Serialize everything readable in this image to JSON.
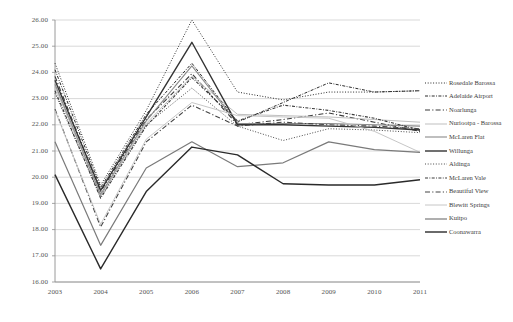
{
  "chart_data": {
    "type": "line",
    "title": "",
    "xlabel": "",
    "ylabel": "",
    "x": [
      2003,
      2004,
      2005,
      2006,
      2007,
      2008,
      2009,
      2010,
      2011
    ],
    "categories": [
      "2003",
      "2004",
      "2005",
      "2006",
      "2007",
      "2008",
      "2009",
      "2010",
      "2011"
    ],
    "ylim": [
      16.0,
      26.0
    ],
    "ytick_labels": [
      "26.00",
      "25.00",
      "24.00",
      "23.00",
      "22.00",
      "21.00",
      "20.00",
      "19.00",
      "18.00",
      "17.00",
      "16.00"
    ],
    "ytick_values": [
      26.0,
      25.0,
      24.0,
      23.0,
      22.0,
      21.0,
      20.0,
      19.0,
      18.0,
      17.0,
      16.0
    ],
    "grid": true,
    "legend_position": "right",
    "series": [
      {
        "name": "Rosedale Barossa",
        "style": "dotted",
        "color": "#2b2b2b",
        "width": 1.0,
        "values": [
          24.35,
          19.7,
          22.55,
          26.0,
          23.25,
          22.95,
          23.25,
          23.25,
          23.3
        ]
      },
      {
        "name": "Adelaide Airport",
        "style": "dash-dot",
        "color": "#2b2b2b",
        "width": 1.0,
        "values": [
          24.1,
          19.6,
          22.4,
          24.35,
          22.1,
          22.85,
          23.6,
          23.25,
          23.3
        ]
      },
      {
        "name": "Nuriootpa",
        "style": "long-dash",
        "color": "#3a3a3a",
        "width": 1.1,
        "values": [
          23.85,
          19.45,
          22.2,
          23.95,
          22.0,
          22.2,
          22.45,
          22.1,
          21.75
        ]
      },
      {
        "name": "Nuriootpa - Barossa",
        "style": "solid",
        "color": "#b8b8b8",
        "width": 0.9,
        "values": [
          23.45,
          19.3,
          22.05,
          23.85,
          22.4,
          22.35,
          22.3,
          22.2,
          22.1
        ]
      },
      {
        "name": "McLaren Flat",
        "style": "solid",
        "color": "#8a8a8a",
        "width": 1.1,
        "values": [
          23.55,
          19.35,
          22.15,
          24.25,
          22.05,
          22.05,
          22.05,
          22.0,
          21.95
        ]
      },
      {
        "name": "Willunga",
        "style": "solid",
        "color": "#333333",
        "width": 1.4,
        "values": [
          23.7,
          19.5,
          22.3,
          25.15,
          22.0,
          22.0,
          21.95,
          21.9,
          21.8
        ]
      },
      {
        "name": "Aldinga",
        "style": "dotted",
        "color": "#4a4a4a",
        "width": 1.0,
        "values": [
          23.2,
          19.25,
          22.0,
          23.4,
          21.95,
          21.4,
          21.85,
          21.8,
          21.7
        ]
      },
      {
        "name": "McLaren Vale",
        "style": "dash-dot",
        "color": "#3a3a3a",
        "width": 1.1,
        "values": [
          23.3,
          19.2,
          21.95,
          23.8,
          22.15,
          22.75,
          22.55,
          22.25,
          21.8
        ]
      },
      {
        "name": "Beautiful View",
        "style": "long-dash",
        "color": "#444444",
        "width": 1.1,
        "values": [
          22.6,
          18.1,
          21.35,
          22.75,
          21.95,
          22.1,
          22.0,
          21.95,
          21.85
        ]
      },
      {
        "name": "Blewitt Springs",
        "style": "solid",
        "color": "#c0c0c0",
        "width": 0.9,
        "values": [
          22.55,
          18.2,
          21.45,
          22.85,
          22.35,
          22.3,
          22.25,
          21.75,
          20.95
        ]
      },
      {
        "name": "Kuitpo",
        "style": "solid",
        "color": "#7a7a7a",
        "width": 1.2,
        "values": [
          21.35,
          17.4,
          20.35,
          21.35,
          20.4,
          20.55,
          21.35,
          21.05,
          20.95
        ]
      },
      {
        "name": "Coonawarra",
        "style": "solid",
        "color": "#2a2a2a",
        "width": 1.4,
        "values": [
          20.1,
          16.5,
          19.45,
          21.15,
          20.85,
          19.75,
          19.7,
          19.7,
          19.9
        ]
      }
    ]
  },
  "legend": {
    "items": [
      {
        "label": "Rosedale Barossa"
      },
      {
        "label": "Adelaide Airport"
      },
      {
        "label": "Noarlunga"
      },
      {
        "label": "Nuriootpa - Barossa"
      },
      {
        "label": "McLaren Flat"
      },
      {
        "label": "Willunga"
      },
      {
        "label": "Aldinga"
      },
      {
        "label": "McLaren Vale"
      },
      {
        "label": "Beautiful View"
      },
      {
        "label": "Blewitt Springs"
      },
      {
        "label": "Kuitpo"
      },
      {
        "label": "Coonawarra"
      }
    ]
  }
}
